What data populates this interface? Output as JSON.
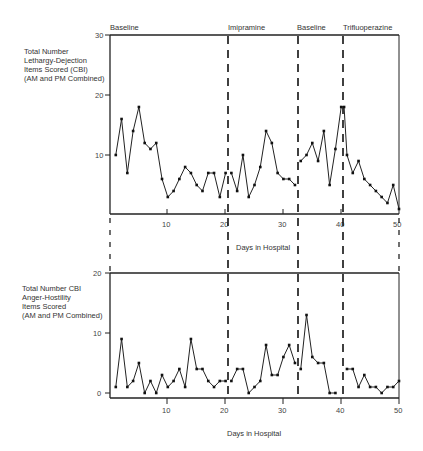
{
  "chart_data": [
    {
      "type": "line",
      "title": "",
      "ylabel_lines": [
        "Total Number",
        "Lethargy-Dejection",
        "Items Scored (CBI)",
        "(AM and PM Combined)"
      ],
      "xlabel": "Days in Hospital",
      "xlim": [
        0,
        50
      ],
      "ylim": [
        0,
        30
      ],
      "yticks": [
        10,
        20,
        30
      ],
      "xticks": [
        10,
        20,
        30,
        40,
        50
      ],
      "grid": false,
      "phases": [
        {
          "label": "Baseline",
          "start": 0,
          "end": 20.5
        },
        {
          "label": "Imipramine",
          "start": 20.5,
          "end": 32.5
        },
        {
          "label": "Baseline",
          "start": 32.5,
          "end": 40.5
        },
        {
          "label": "Trifluoperazine",
          "start": 40.5,
          "end": 50
        }
      ],
      "series": [
        {
          "name": "Baseline 1",
          "x": [
            1,
            2,
            3,
            4,
            5,
            6,
            7,
            8,
            9,
            10,
            11,
            12,
            13,
            14,
            15,
            16,
            17,
            18,
            19,
            20
          ],
          "y": [
            10,
            16,
            7,
            14,
            18,
            12,
            11,
            12,
            6,
            3,
            4,
            6,
            8,
            7,
            5,
            4,
            7,
            7,
            3,
            7
          ]
        },
        {
          "name": "Imipramine",
          "x": [
            21,
            22,
            23,
            24,
            25,
            26,
            27,
            28,
            29,
            30,
            31,
            32
          ],
          "y": [
            7,
            4,
            10,
            3,
            5,
            8,
            14,
            12,
            7,
            6,
            6,
            5
          ]
        },
        {
          "name": "Baseline 2",
          "x": [
            33,
            34,
            35,
            36,
            37,
            38,
            39,
            40
          ],
          "y": [
            9,
            10,
            12,
            9,
            14,
            5,
            11,
            18
          ]
        },
        {
          "name": "Trifluoperazine",
          "x": [
            40.5,
            41,
            42,
            43,
            44,
            45,
            46,
            47,
            48,
            49,
            50
          ],
          "y": [
            18,
            10,
            7,
            9,
            6,
            5,
            4,
            3,
            2,
            5,
            1
          ]
        }
      ]
    },
    {
      "type": "line",
      "title": "",
      "ylabel_lines": [
        "Total Number CBI",
        "Anger-Hostility",
        "Items Scored",
        "(AM and PM Combined)"
      ],
      "xlabel": "Days in Hospital",
      "xlim": [
        0,
        50
      ],
      "ylim": [
        0,
        20
      ],
      "yticks": [
        0,
        10,
        20
      ],
      "xticks": [
        10,
        20,
        30,
        40,
        50
      ],
      "grid": false,
      "phases": [
        {
          "label": "Baseline",
          "start": 0,
          "end": 20.5
        },
        {
          "label": "Imipramine",
          "start": 20.5,
          "end": 32.5
        },
        {
          "label": "Baseline",
          "start": 32.5,
          "end": 40.5
        },
        {
          "label": "Trifluoperazine",
          "start": 40.5,
          "end": 50
        }
      ],
      "series": [
        {
          "name": "Baseline 1",
          "x": [
            1,
            2,
            3,
            4,
            5,
            6,
            7,
            8,
            9,
            10,
            11,
            12,
            13,
            14,
            15,
            16,
            17,
            18,
            19,
            20
          ],
          "y": [
            1,
            9,
            1,
            2,
            5,
            0,
            2,
            0,
            3,
            1,
            2,
            4,
            1,
            9,
            4,
            4,
            2,
            1,
            2,
            2
          ]
        },
        {
          "name": "Imipramine",
          "x": [
            21,
            22,
            23,
            24,
            25,
            26,
            27,
            28,
            29,
            30,
            31,
            32
          ],
          "y": [
            2,
            4,
            4,
            0,
            1,
            2,
            8,
            3,
            3,
            6,
            8,
            5
          ]
        },
        {
          "name": "Baseline 2",
          "x": [
            33,
            34,
            35,
            36,
            37,
            38,
            39
          ],
          "y": [
            4,
            13,
            6,
            5,
            5,
            0,
            0
          ]
        },
        {
          "name": "Trifluoperazine",
          "x": [
            41,
            42,
            43,
            44,
            45,
            46,
            47,
            48,
            49,
            50
          ],
          "y": [
            4,
            4,
            1,
            3,
            1,
            1,
            0,
            1,
            1,
            2
          ]
        }
      ]
    }
  ],
  "labels": {
    "top_ylabel": [
      "Total Number",
      "Lethargy-Dejection",
      "Items Scored (CBI)",
      "(AM and PM Combined)"
    ],
    "bottom_ylabel": [
      "Total Number CBI",
      "Anger-Hostility",
      "Items Scored",
      "(AM and PM Combined)"
    ],
    "xlabel": "Days in Hospital",
    "phases": [
      "Baseline",
      "Imipramine",
      "Baseline",
      "Trifluoperazine"
    ],
    "top_yticks": [
      "10",
      "20",
      "30"
    ],
    "bottom_yticks": [
      "0",
      "10",
      "20"
    ],
    "xticks": [
      "10",
      "20",
      "30",
      "40",
      "50"
    ]
  }
}
